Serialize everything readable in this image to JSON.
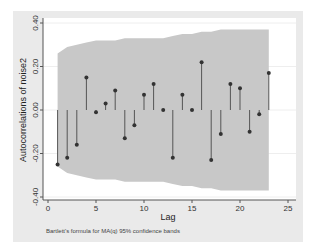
{
  "chart_data": {
    "type": "line",
    "subtype": "stem (autocorrelation correlogram with confidence band)",
    "title": "",
    "xlabel": "Lag",
    "ylabel": "Autocorrelations of noise2",
    "note": "Bartlett's formula for MA(q) 95% confidence bands",
    "xlim": [
      0,
      25
    ],
    "ylim": [
      -0.4,
      0.4
    ],
    "xticks": [
      0,
      5,
      10,
      15,
      20,
      25
    ],
    "yticks": [
      -0.4,
      -0.2,
      0.0,
      0.2,
      0.4
    ],
    "ytick_labels": [
      "-0.40",
      "-0.20",
      "0.00",
      "0.20",
      "0.40"
    ],
    "grid": "horizontal",
    "legend": "none",
    "x": [
      1,
      2,
      3,
      4,
      5,
      6,
      7,
      8,
      9,
      10,
      11,
      12,
      13,
      14,
      15,
      16,
      17,
      18,
      19,
      20,
      21,
      22,
      23
    ],
    "series": [
      {
        "name": "Autocorrelations",
        "values": [
          -0.25,
          -0.22,
          -0.16,
          0.15,
          -0.01,
          0.03,
          0.09,
          -0.13,
          -0.07,
          0.07,
          0.12,
          0.0,
          -0.22,
          0.07,
          0.0,
          0.22,
          -0.23,
          -0.11,
          0.12,
          0.1,
          -0.1,
          -0.02,
          0.17
        ]
      },
      {
        "name": "95% confidence band (upper)",
        "values": [
          0.26,
          0.29,
          0.3,
          0.31,
          0.32,
          0.32,
          0.32,
          0.33,
          0.33,
          0.33,
          0.33,
          0.33,
          0.34,
          0.35,
          0.35,
          0.36,
          0.36,
          0.37,
          0.37,
          0.37,
          0.37,
          0.37,
          0.37
        ]
      },
      {
        "name": "95% confidence band (lower)",
        "values": [
          -0.26,
          -0.29,
          -0.3,
          -0.31,
          -0.32,
          -0.32,
          -0.32,
          -0.33,
          -0.33,
          -0.33,
          -0.33,
          -0.33,
          -0.34,
          -0.35,
          -0.35,
          -0.36,
          -0.36,
          -0.37,
          -0.37,
          -0.37,
          -0.37,
          -0.37,
          -0.37
        ]
      }
    ],
    "colors": {
      "outer_background": "#eaeaea",
      "plot_background": "#ffffff",
      "band": "#c8c8c8",
      "stem": "#555555",
      "marker": "#333333",
      "gridline": "#eeeeee"
    }
  }
}
